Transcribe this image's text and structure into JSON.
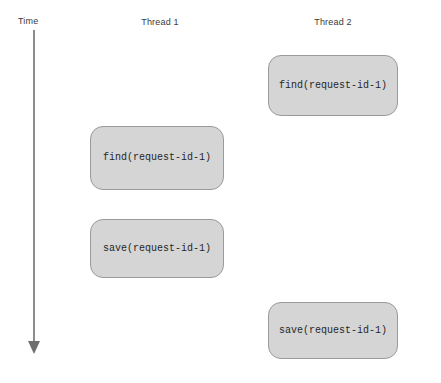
{
  "diagram": {
    "width": 441,
    "height": 383,
    "background": "#ffffff",
    "axis": {
      "label": "Time",
      "direction": "downward",
      "line_color": "#8c8c8c",
      "arrow_color": "#6f6f6f",
      "x": 34,
      "start_y": 30,
      "end_y": 354
    },
    "columns": [
      {
        "id": "thread-1",
        "label": "Thread 1",
        "center_x": 160,
        "label_y": 17
      },
      {
        "id": "thread-2",
        "label": "Thread 2",
        "center_x": 333,
        "label_y": 17
      }
    ],
    "colors": {
      "box_fill": "#d5d5d5",
      "box_border": "#9a9a9a",
      "text": "#262626",
      "header_text": "#3a3a3a",
      "axis": "#8c8c8c"
    },
    "operations": [
      {
        "id": "t2-find",
        "column": "thread-2",
        "operation": "find",
        "argument": "request-id-1",
        "label": "find(request-id-1)",
        "x": 268,
        "y": 55,
        "width": 130,
        "height": 61,
        "order": 1
      },
      {
        "id": "t1-find",
        "column": "thread-1",
        "operation": "find",
        "argument": "request-id-1",
        "label": "find(request-id-1)",
        "x": 90,
        "y": 126,
        "width": 134,
        "height": 64,
        "order": 2
      },
      {
        "id": "t1-save",
        "column": "thread-1",
        "operation": "save",
        "argument": "request-id-1",
        "label": "save(request-id-1)",
        "x": 90,
        "y": 219,
        "width": 134,
        "height": 59,
        "order": 3
      },
      {
        "id": "t2-save",
        "column": "thread-2",
        "operation": "save",
        "argument": "request-id-1",
        "label": "save(request-id-1)",
        "x": 268,
        "y": 302,
        "width": 130,
        "height": 57,
        "order": 4
      }
    ]
  }
}
